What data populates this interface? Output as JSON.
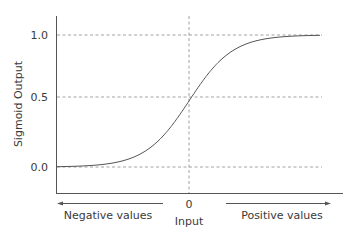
{
  "chart_data": {
    "type": "line",
    "title": "",
    "xlabel": "Input",
    "ylabel": "Sigmoid Output",
    "x_ticks": [
      "0"
    ],
    "y_ticks": [
      "0.0",
      "0.5",
      "1.0"
    ],
    "ylim": [
      0,
      1
    ],
    "xlim": [
      -6,
      6
    ],
    "grid": "dashed at y=0.0, 0.5, 1.0 and x=0",
    "series": [
      {
        "name": "sigmoid",
        "function": "1/(1+e^-x)",
        "x": [
          -6,
          -5,
          -4,
          -3,
          -2,
          -1,
          0,
          1,
          2,
          3,
          4,
          5,
          6
        ],
        "y": [
          0.0025,
          0.0067,
          0.018,
          0.047,
          0.119,
          0.269,
          0.5,
          0.731,
          0.881,
          0.953,
          0.982,
          0.993,
          0.9975
        ]
      }
    ],
    "annotations": [
      {
        "text": "Negative values",
        "arrow": "left"
      },
      {
        "text": "Positive values",
        "arrow": "right"
      }
    ]
  },
  "labels": {
    "ylabel": "Sigmoid Output",
    "xlabel": "Input",
    "ytick_top": "1.0",
    "ytick_mid": "0.5",
    "ytick_bottom": "0.0",
    "xtick_zero": "0",
    "negative": "Negative values",
    "positive": "Positive values"
  },
  "colors": {
    "axis": "#555555",
    "grid": "#777777",
    "curve": "#555555",
    "text": "#3a3a3a"
  }
}
